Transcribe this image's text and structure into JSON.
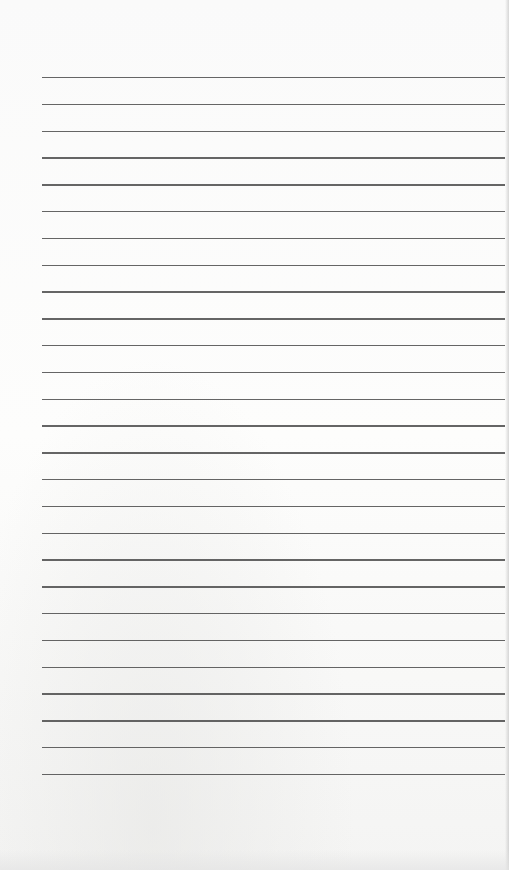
{
  "document": {
    "type": "lined-paper",
    "line_count": 27,
    "line_color": "#4a4a4a",
    "paper_color": "#fbfbfa",
    "first_line_y": 77,
    "line_spacing": 26.8,
    "line_left": 42,
    "line_width": 463
  }
}
